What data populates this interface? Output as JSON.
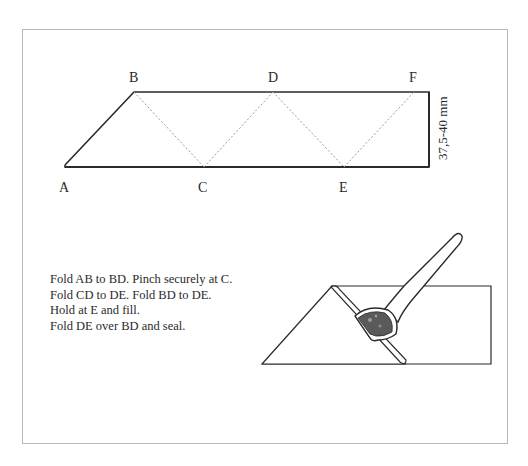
{
  "diagram": {
    "points": {
      "A": "A",
      "B": "B",
      "C": "C",
      "D": "D",
      "E": "E",
      "F": "F"
    },
    "dimension_label": "37,5-40 mm",
    "instructions": [
      "Fold AB to BD. Pinch securely at C.",
      "Fold CD to DE. Fold BD to DE.",
      "Hold at E and fill.",
      "Fold DE over BD and seal."
    ],
    "colors": {
      "line": "#2a2a2a",
      "fold_line": "#9a9a9a",
      "frame": "#b8b8b8",
      "filling": "#5a5a5a"
    }
  }
}
